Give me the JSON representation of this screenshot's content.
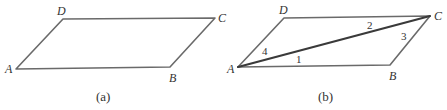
{
  "figures": [
    {
      "id": "a",
      "caption": "(a)",
      "vertices": {
        "A": "A",
        "B": "B",
        "C": "C",
        "D": "D"
      },
      "diagonal": false
    },
    {
      "id": "b",
      "caption": "(b)",
      "vertices": {
        "A": "A",
        "B": "B",
        "C": "C",
        "D": "D"
      },
      "diagonal": true,
      "angle_labels": [
        "1",
        "2",
        "3",
        "4"
      ]
    }
  ],
  "colors": {
    "edge": "#6a6a6a",
    "diagonal": "#3a3a3a",
    "text": "#333333"
  }
}
